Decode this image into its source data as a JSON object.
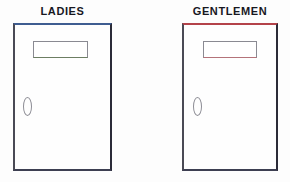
{
  "scene": {
    "background_color": "#fdfdfd",
    "width": 290,
    "height": 182
  },
  "doors": [
    {
      "id": "ladies",
      "label": "LADIES",
      "label_color": "#18181f",
      "panel": {
        "fill_color": "#fefefe",
        "border_top_color": "#3f5d91",
        "border_right_color": "#2b2b38",
        "border_bottom_color": "#3d3f52",
        "border_left_color": "#4a4a55"
      },
      "sign": {
        "name": "blank-sign-plate",
        "text": "",
        "fill_color": "#ffffff",
        "border_color": "#8a8a92",
        "accent_color": "#6d7e63"
      },
      "knob": {
        "name": "door-knob-oval",
        "shape": "oval",
        "stroke_color": "#8d8d95"
      }
    },
    {
      "id": "gentlemen",
      "label": "GENTLEMEN",
      "label_color": "#18181f",
      "panel": {
        "fill_color": "#fefefe",
        "border_top_color": "#b4434a",
        "border_right_color": "#2b2b38",
        "border_bottom_color": "#3d3f52",
        "border_left_color": "#4a4a55"
      },
      "sign": {
        "name": "blank-sign-plate",
        "text": "",
        "fill_color": "#ffffff",
        "border_color": "#8a8a92",
        "accent_color": "#b4737a"
      },
      "knob": {
        "name": "door-knob-oval",
        "shape": "oval",
        "stroke_color": "#8d8d95"
      }
    }
  ]
}
